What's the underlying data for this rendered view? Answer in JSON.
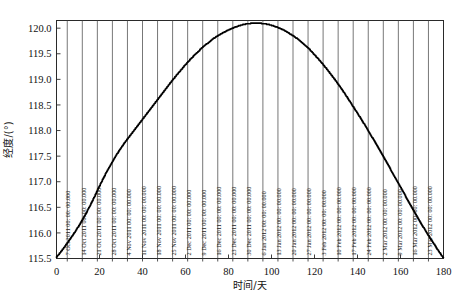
{
  "figure": {
    "width": 456,
    "height": 292,
    "background": "#ffffff",
    "top_cut_text": "· · ·  ··· · ·· ·· ·· ·· ·· ··"
  },
  "chart_data": {
    "type": "line",
    "title": "",
    "xlabel": "时间/天",
    "ylabel": "经度/(°)",
    "xlim": [
      0,
      180
    ],
    "ylim": [
      115.5,
      120.15
    ],
    "xticks": [
      0,
      20,
      40,
      60,
      80,
      100,
      120,
      140,
      160,
      180
    ],
    "xticklabels": [
      "0",
      "20",
      "40",
      "60",
      "80",
      "100",
      "120",
      "140",
      "160",
      "180"
    ],
    "yticks": [
      115.5,
      116.0,
      116.5,
      117.0,
      117.5,
      118.0,
      118.5,
      119.0,
      119.5,
      120.0
    ],
    "yticklabels": [
      "115.5",
      "116.0",
      "116.5",
      "117.0",
      "117.5",
      "118.0",
      "118.5",
      "119.0",
      "119.5",
      "120.0"
    ],
    "grid": "vertical-only",
    "legend": "none",
    "line_color": "#000000",
    "line_width": 1.6,
    "series": [
      {
        "name": "经度",
        "x": [
          0,
          2,
          4,
          6,
          8,
          10,
          12,
          14,
          16,
          18,
          20,
          22,
          24,
          26,
          28,
          30,
          32,
          34,
          36,
          38,
          40,
          42,
          44,
          46,
          48,
          50,
          52,
          54,
          56,
          58,
          60,
          62,
          64,
          66,
          68,
          70,
          72,
          74,
          76,
          78,
          80,
          82,
          84,
          86,
          88,
          90,
          92,
          94,
          96,
          98,
          100,
          102,
          104,
          106,
          108,
          110,
          112,
          114,
          116,
          118,
          120,
          122,
          124,
          126,
          128,
          130,
          132,
          134,
          136,
          138,
          140,
          142,
          144,
          146,
          148,
          150,
          152,
          154,
          156,
          158,
          160,
          162,
          164,
          166,
          168,
          170,
          172,
          174,
          176,
          178,
          180
        ],
        "y": [
          115.52,
          115.62,
          115.73,
          115.85,
          115.97,
          116.1,
          116.24,
          116.39,
          116.55,
          116.72,
          116.9,
          117.07,
          117.23,
          117.38,
          117.52,
          117.65,
          117.77,
          117.88,
          117.99,
          118.1,
          118.21,
          118.32,
          118.43,
          118.54,
          118.65,
          118.76,
          118.87,
          118.98,
          119.08,
          119.18,
          119.28,
          119.37,
          119.46,
          119.54,
          119.62,
          119.69,
          119.76,
          119.82,
          119.87,
          119.92,
          119.96,
          120.0,
          120.03,
          120.06,
          120.08,
          120.09,
          120.1,
          120.1,
          120.09,
          120.08,
          120.06,
          120.03,
          120.0,
          119.96,
          119.91,
          119.86,
          119.8,
          119.73,
          119.66,
          119.58,
          119.49,
          119.4,
          119.3,
          119.2,
          119.09,
          118.98,
          118.86,
          118.74,
          118.61,
          118.48,
          118.35,
          118.22,
          118.08,
          117.94,
          117.8,
          117.66,
          117.51,
          117.36,
          117.21,
          117.06,
          116.91,
          116.76,
          116.61,
          116.46,
          116.31,
          116.17,
          116.03,
          115.9,
          115.77,
          115.64,
          115.52
        ]
      }
    ],
    "date_gridlines": [
      {
        "day": 5,
        "label": "7 Oct 2011 00: 00: 00.000"
      },
      {
        "day": 12,
        "label": "14 Oct 2011 00: 00: 00.000"
      },
      {
        "day": 19,
        "label": "21 Oct 2011 00: 00: 00.000"
      },
      {
        "day": 26,
        "label": "28 Oct 2011 00: 00: 00.000"
      },
      {
        "day": 33,
        "label": "4 Nov 2011 00: 00: 00.000"
      },
      {
        "day": 40,
        "label": "11 Nov 2011 00: 00: 00.000"
      },
      {
        "day": 47,
        "label": "18 Nov 2011 00: 00: 00.000"
      },
      {
        "day": 54,
        "label": "25 Nov 2011 00: 00: 00.000"
      },
      {
        "day": 61,
        "label": "2 Dec 2011 00: 00: 00.000"
      },
      {
        "day": 68,
        "label": "9 Dec 2011 00: 00: 00.000"
      },
      {
        "day": 75,
        "label": "16 Dec 2011 00: 00: 00.000"
      },
      {
        "day": 82,
        "label": "23 Dec 2011 00: 00: 00.000"
      },
      {
        "day": 89,
        "label": "30 Dec 2011 00: 00: 00.000"
      },
      {
        "day": 96,
        "label": "6 Jan 2012 00: 00: 00.000"
      },
      {
        "day": 103,
        "label": "13 Jan 2012 00: 00: 00.000"
      },
      {
        "day": 110,
        "label": "20 Jan 2012 00: 00: 00.000"
      },
      {
        "day": 117,
        "label": "27 Jan 2012 00: 00: 00.000"
      },
      {
        "day": 124,
        "label": "3 Feb 2012 00: 00: 00.000"
      },
      {
        "day": 131,
        "label": "10 Feb 2012 00: 00: 00.000"
      },
      {
        "day": 138,
        "label": "17 Feb 2012 00: 00: 00.000"
      },
      {
        "day": 145,
        "label": "24 Feb 2012 00: 00: 00.000"
      },
      {
        "day": 152,
        "label": "2 Mar 2012 00: 00: 00.000"
      },
      {
        "day": 159,
        "label": "9 Mar 2012 00: 00: 00.000"
      },
      {
        "day": 166,
        "label": "16 Mar 2012 00: 00: 00.000"
      },
      {
        "day": 173,
        "label": "23 Mar 2012 00: 00: 00.000"
      }
    ]
  }
}
